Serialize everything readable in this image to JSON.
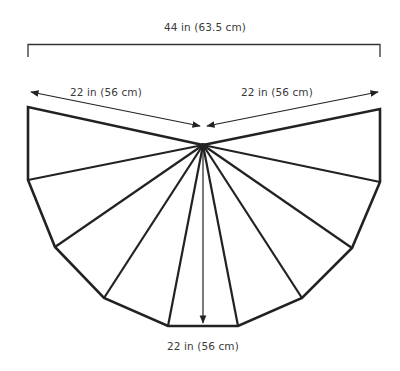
{
  "diagram": {
    "type": "schematic",
    "labels": {
      "top_width": "44 in (63.5 cm)",
      "left_radius": "22 in (56 cm)",
      "right_radius": "22 in (56 cm)",
      "depth": "22 in (56 cm)"
    },
    "colors": {
      "stroke": "#222222",
      "text": "#3a3a3a",
      "background": "#ffffff"
    },
    "geometry": {
      "center": [
        203,
        145
      ],
      "outline_vertices": [
        [
          28,
          107
        ],
        [
          28,
          180
        ],
        [
          55,
          247
        ],
        [
          104,
          298
        ],
        [
          168,
          326
        ],
        [
          238,
          326
        ],
        [
          302,
          298
        ],
        [
          352,
          248
        ],
        [
          380,
          182
        ],
        [
          380,
          109
        ]
      ],
      "panel_count": 9
    }
  }
}
